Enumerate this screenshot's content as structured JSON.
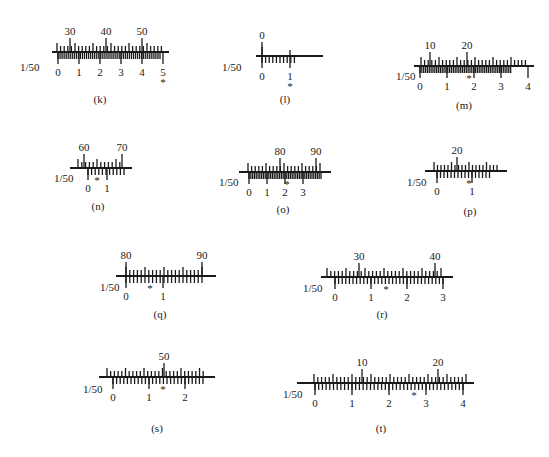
{
  "figure": {
    "vernier_label": "1/50",
    "marker": "*",
    "scales": [
      {
        "id": "k",
        "caption": "(k)",
        "x0": 58,
        "y": 52,
        "len": 105,
        "main_labels": [
          "30",
          "40",
          "50"
        ],
        "main_label_pos": [
          12,
          48,
          84
        ],
        "main_step": 3.6,
        "main_start": -1,
        "main_count": 30,
        "vern_labels": [
          "0",
          "1",
          "2",
          "3",
          "4",
          "5"
        ],
        "vern_step": 2.04,
        "vern_count": 51,
        "marker_index": 50,
        "marker_below": true,
        "label_x": 20,
        "label_y": 71,
        "cap_x": 100,
        "cap_y": 103
      },
      {
        "id": "l",
        "caption": "(l)",
        "x0": 262,
        "y": 56,
        "len": 55,
        "main_labels": [
          "0"
        ],
        "main_label_pos": [
          0
        ],
        "main_step": 28,
        "main_start": 0,
        "main_count": 2,
        "vern_labels": [
          "0",
          "1"
        ],
        "vern_step": 3.6,
        "vern_count": 10,
        "vern_label_pos": [
          0,
          28
        ],
        "marker_index": 28,
        "marker_below": true,
        "label_x": 222,
        "label_y": 71,
        "cap_x": 285,
        "cap_y": 103
      },
      {
        "id": "m",
        "caption": "(m)",
        "x0": 420,
        "y": 66,
        "len": 108,
        "main_labels": [
          "10",
          "20"
        ],
        "main_label_pos": [
          10,
          47
        ],
        "main_step": 3.6,
        "main_start": 1,
        "main_count": 30,
        "vern_labels": [
          "0",
          "1",
          "2",
          "3",
          "4"
        ],
        "vern_step": 1.85,
        "vern_count": 50,
        "marker_index": 49,
        "marker_below": false,
        "label_x": 396,
        "label_y": 80,
        "cap_x": 464,
        "cap_y": 109
      },
      {
        "id": "n",
        "caption": "(n)",
        "x0": 76,
        "y": 168,
        "len": 50,
        "main_labels": [
          "60",
          "70"
        ],
        "main_label_pos": [
          8,
          46
        ],
        "main_step": 3.8,
        "main_start": 2,
        "main_count": 12,
        "vern_labels": [
          "0",
          "1"
        ],
        "vern_step": 3.6,
        "vern_count": 11,
        "vern_label_pos": [
          12,
          31
        ],
        "marker_index": 21,
        "marker_below": false,
        "label_x": 54,
        "label_y": 182,
        "cap_x": 98,
        "cap_y": 210
      },
      {
        "id": "o",
        "caption": "(o)",
        "x0": 245,
        "y": 172,
        "len": 80,
        "main_labels": [
          "80",
          "90"
        ],
        "main_label_pos": [
          35,
          71
        ],
        "main_step": 3.6,
        "main_start": 3,
        "main_count": 21,
        "vern_labels": [
          "0",
          "1",
          "2",
          "3"
        ],
        "vern_step": 1.8,
        "vern_count": 41,
        "vern_label_pos": [
          4,
          22,
          40,
          58
        ],
        "marker_index": 42,
        "marker_below": false,
        "label_x": 219,
        "label_y": 186,
        "cap_x": 283,
        "cap_y": 213
      },
      {
        "id": "p",
        "caption": "(p)",
        "x0": 431,
        "y": 171,
        "len": 70,
        "main_labels": [
          "20"
        ],
        "main_label_pos": [
          26
        ],
        "main_step": 3.5,
        "main_start": 3,
        "main_count": 19,
        "vern_labels": [
          "0",
          "1"
        ],
        "vern_step": 3.5,
        "vern_count": 16,
        "vern_label_pos": [
          6,
          41
        ],
        "marker_index": 38,
        "marker_below": false,
        "label_x": 407,
        "label_y": 186,
        "cap_x": 470,
        "cap_y": 215
      },
      {
        "id": "q",
        "caption": "(q)",
        "x0": 122,
        "y": 276,
        "len": 88,
        "main_labels": [
          "80",
          "90"
        ],
        "main_label_pos": [
          4,
          80
        ],
        "main_step": 3.8,
        "main_start": 4,
        "main_count": 21,
        "vern_labels": [
          "0",
          "1"
        ],
        "vern_step": 3.8,
        "vern_count": 21,
        "vern_label_pos": [
          4,
          41
        ],
        "marker_index": 28,
        "marker_below": false,
        "label_x": 100,
        "label_y": 291,
        "cap_x": 160,
        "cap_y": 318
      },
      {
        "id": "r",
        "caption": "(r)",
        "x0": 327,
        "y": 277,
        "len": 120,
        "main_labels": [
          "30",
          "40"
        ],
        "main_label_pos": [
          32,
          108
        ],
        "main_step": 3.8,
        "main_start": 0,
        "main_count": 31,
        "vern_labels": [
          "0",
          "1",
          "2",
          "3"
        ],
        "vern_step": 3.6,
        "vern_count": 31,
        "vern_label_pos": [
          8,
          44,
          80,
          116
        ],
        "marker_index": 59,
        "marker_below": false,
        "label_x": 303,
        "label_y": 292,
        "cap_x": 382,
        "cap_y": 318
      },
      {
        "id": "s",
        "caption": "(s)",
        "x0": 105,
        "y": 377,
        "len": 104,
        "main_labels": [
          "50"
        ],
        "main_label_pos": [
          59
        ],
        "main_step": 3.7,
        "main_start": 2,
        "main_count": 27,
        "vern_labels": [
          "0",
          "1",
          "2"
        ],
        "vern_step": 3.6,
        "vern_count": 26,
        "vern_label_pos": [
          8,
          44,
          80
        ],
        "marker_index": 58,
        "marker_below": false,
        "label_x": 83,
        "label_y": 393,
        "cap_x": 157,
        "cap_y": 432
      },
      {
        "id": "t",
        "caption": "(t)",
        "x0": 303,
        "y": 383,
        "len": 165,
        "main_labels": [
          "10",
          "20"
        ],
        "main_label_pos": [
          59,
          135
        ],
        "main_step": 3.8,
        "main_start": 11,
        "main_count": 41,
        "vern_labels": [
          "0",
          "1",
          "2",
          "3",
          "4"
        ],
        "vern_step": 3.7,
        "vern_count": 41,
        "vern_label_pos": [
          12,
          49,
          86,
          123,
          160
        ],
        "marker_index": 111,
        "marker_below": false,
        "label_x": 283,
        "label_y": 398,
        "cap_x": 381,
        "cap_y": 432
      }
    ]
  }
}
